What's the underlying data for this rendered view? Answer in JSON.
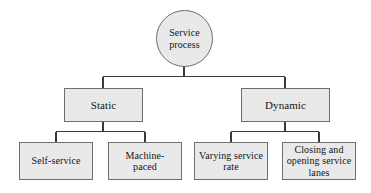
{
  "diagram": {
    "type": "hierarchy-tree",
    "orientation": "top-down",
    "colors": {
      "node_fill": "#e9e9e9",
      "node_border": "#6e6e6e",
      "connector": "#3a3a3a",
      "background": "#ffffff",
      "text": "#141414"
    },
    "root": {
      "id": "service-process",
      "label": "Service\nprocess",
      "shape": "ellipse"
    },
    "level1": [
      {
        "id": "static",
        "label": "Static",
        "shape": "rectangle"
      },
      {
        "id": "dynamic",
        "label": "Dynamic",
        "shape": "rectangle"
      }
    ],
    "level2": [
      {
        "id": "self-service",
        "label": "Self-service",
        "shape": "rectangle",
        "parent": "static"
      },
      {
        "id": "machine-paced",
        "label": "Machine-\npaced",
        "shape": "rectangle",
        "parent": "static"
      },
      {
        "id": "varying-service-rate",
        "label": "Varying service\nrate",
        "shape": "rectangle",
        "parent": "dynamic"
      },
      {
        "id": "closing-opening-service-lanes",
        "label": "Closing and\nopening service\nlanes",
        "shape": "rectangle",
        "parent": "dynamic"
      }
    ]
  }
}
